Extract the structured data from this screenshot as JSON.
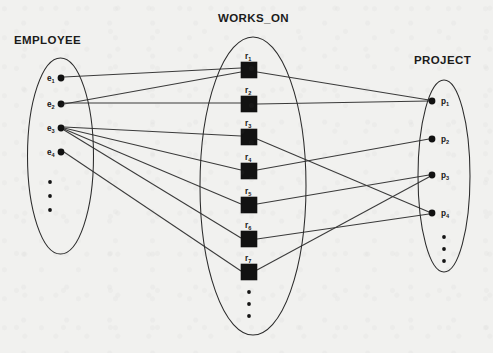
{
  "diagram": {
    "type": "er-instance-diagram",
    "background_color": "#f1f1ef",
    "line_color": "#3a3a3a",
    "node_color": "#121212",
    "sets": [
      {
        "id": "employee",
        "title": "EMPLOYEE",
        "shape": "ellipse",
        "title_x": 14,
        "title_y": 44,
        "cx": 60.5,
        "cy": 156,
        "rx": 33,
        "ry": 98,
        "node_shape": "dot",
        "label_side": "left",
        "nodes": [
          {
            "id": "e1",
            "base": "e",
            "sub": "1",
            "x": 61,
            "y": 78
          },
          {
            "id": "e2",
            "base": "e",
            "sub": "2",
            "x": 61,
            "y": 104
          },
          {
            "id": "e3",
            "base": "e",
            "sub": "3",
            "x": 61,
            "y": 128
          },
          {
            "id": "e4",
            "base": "e",
            "sub": "4",
            "x": 61,
            "y": 152
          }
        ],
        "continuation_dots": [
          {
            "x": 50,
            "y": 182
          },
          {
            "x": 50,
            "y": 196
          },
          {
            "x": 50,
            "y": 210
          }
        ]
      },
      {
        "id": "works_on",
        "title": "WORKS_ON",
        "shape": "ellipse",
        "title_x": 218,
        "title_y": 22,
        "cx": 253,
        "cy": 186,
        "rx": 53,
        "ry": 149,
        "node_shape": "square",
        "label_side": "top",
        "nodes": [
          {
            "id": "r1",
            "base": "r",
            "sub": "1",
            "x": 249,
            "y": 70
          },
          {
            "id": "r2",
            "base": "r",
            "sub": "2",
            "x": 249,
            "y": 104
          },
          {
            "id": "r3",
            "base": "r",
            "sub": "3",
            "x": 249,
            "y": 137
          },
          {
            "id": "r4",
            "base": "r",
            "sub": "4",
            "x": 249,
            "y": 171
          },
          {
            "id": "r5",
            "base": "r",
            "sub": "5",
            "x": 249,
            "y": 205
          },
          {
            "id": "r6",
            "base": "r",
            "sub": "6",
            "x": 249,
            "y": 239
          },
          {
            "id": "r7",
            "base": "r",
            "sub": "7",
            "x": 249,
            "y": 272
          }
        ],
        "continuation_dots": [
          {
            "x": 249,
            "y": 292
          },
          {
            "x": 249,
            "y": 304
          },
          {
            "x": 249,
            "y": 316
          }
        ]
      },
      {
        "id": "project",
        "title": "PROJECT",
        "shape": "ellipse",
        "title_x": 414,
        "title_y": 64,
        "cx": 444,
        "cy": 176,
        "rx": 26,
        "ry": 96,
        "node_shape": "dot",
        "label_side": "right",
        "nodes": [
          {
            "id": "p1",
            "base": "p",
            "sub": "1",
            "x": 432,
            "y": 101
          },
          {
            "id": "p2",
            "base": "p",
            "sub": "2",
            "x": 432,
            "y": 139
          },
          {
            "id": "p3",
            "base": "p",
            "sub": "3",
            "x": 432,
            "y": 175
          },
          {
            "id": "p4",
            "base": "p",
            "sub": "4",
            "x": 432,
            "y": 213
          }
        ],
        "continuation_dots": [
          {
            "x": 444,
            "y": 237
          },
          {
            "x": 444,
            "y": 249
          },
          {
            "x": 444,
            "y": 261
          }
        ]
      }
    ],
    "edges": [
      {
        "id": "e1-r1",
        "from": "e1",
        "to": "r1",
        "x1": 64,
        "y1": 77,
        "x2": 241,
        "y2": 68
      },
      {
        "id": "e2-r2",
        "from": "e2",
        "to": "r2",
        "x1": 64,
        "y1": 103,
        "x2": 241,
        "y2": 103
      },
      {
        "id": "e2-r1",
        "from": "e2",
        "to": "r1",
        "x1": 64,
        "y1": 104,
        "x2": 241,
        "y2": 72
      },
      {
        "id": "e3-r3",
        "from": "e3",
        "to": "r3",
        "x1": 64,
        "y1": 127,
        "x2": 241,
        "y2": 136
      },
      {
        "id": "e3-r4",
        "from": "e3",
        "to": "r4",
        "x1": 64,
        "y1": 128,
        "x2": 241,
        "y2": 170
      },
      {
        "id": "e3-r5",
        "from": "e3",
        "to": "r5",
        "x1": 64,
        "y1": 129,
        "x2": 241,
        "y2": 204
      },
      {
        "id": "e3-r6",
        "from": "e3",
        "to": "r6",
        "x1": 64,
        "y1": 130,
        "x2": 241,
        "y2": 238
      },
      {
        "id": "e4-r7",
        "from": "e4",
        "to": "r7",
        "x1": 64,
        "y1": 152,
        "x2": 241,
        "y2": 271
      },
      {
        "id": "r1-p1",
        "from": "r1",
        "to": "p1",
        "x1": 257,
        "y1": 72,
        "x2": 429,
        "y2": 100
      },
      {
        "id": "r2-p1",
        "from": "r2",
        "to": "p1",
        "x1": 257,
        "y1": 104,
        "x2": 429,
        "y2": 101
      },
      {
        "id": "r3-p4",
        "from": "r3",
        "to": "p4",
        "x1": 257,
        "y1": 139,
        "x2": 429,
        "y2": 212
      },
      {
        "id": "r4-p2",
        "from": "r4",
        "to": "p2",
        "x1": 257,
        "y1": 170,
        "x2": 429,
        "y2": 139
      },
      {
        "id": "r5-p3",
        "from": "r5",
        "to": "p3",
        "x1": 257,
        "y1": 204,
        "x2": 429,
        "y2": 175
      },
      {
        "id": "r6-p4",
        "from": "r6",
        "to": "p4",
        "x1": 257,
        "y1": 239,
        "x2": 429,
        "y2": 214
      },
      {
        "id": "r7-p3",
        "from": "r7",
        "to": "p3",
        "x1": 257,
        "y1": 270,
        "x2": 429,
        "y2": 177
      }
    ]
  }
}
